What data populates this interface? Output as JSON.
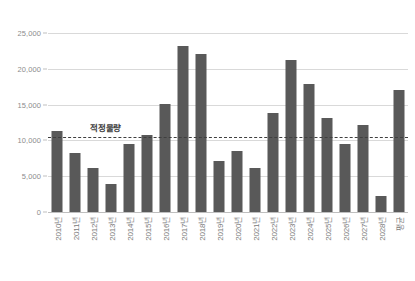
{
  "chart_data": {
    "type": "bar",
    "title": "",
    "subtitle": "",
    "xlabel": "",
    "ylabel": "",
    "ylim": [
      0,
      25000
    ],
    "yticks": [
      "0",
      "5,000",
      "10,000",
      "15,000",
      "20,000",
      "25,000"
    ],
    "ytick_values": [
      0,
      5000,
      10000,
      15000,
      20000,
      25000
    ],
    "grid": true,
    "legend_position": "none",
    "bar_color": "#595959",
    "gridline_color": "#d9d9d9",
    "categories": [
      "2010년",
      "2011년",
      "2012년",
      "2013년",
      "2014년",
      "2015년",
      "2016년",
      "2017년",
      "2018년",
      "2019년",
      "2020년",
      "2021년",
      "2022년",
      "2023년",
      "2024년",
      "2025년",
      "2026년",
      "2027년",
      "2028년",
      "평균"
    ],
    "values": [
      11300,
      8200,
      6200,
      3900,
      9500,
      10800,
      15100,
      23200,
      22000,
      7100,
      8500,
      6100,
      13800,
      21200,
      17900,
      13100,
      9500,
      12200,
      2300,
      17000
    ],
    "series": [
      {
        "name": "물량",
        "values": [
          11300,
          8200,
          6200,
          3900,
          9500,
          10800,
          15100,
          23200,
          22000,
          7100,
          8500,
          6100,
          13800,
          21200,
          17900,
          13100,
          9500,
          12200,
          2300,
          17000
        ]
      }
    ],
    "annotations": [
      {
        "name": "target-line",
        "label": "적정물량",
        "value": 10500,
        "style": "dashed",
        "color": "#3f3f3f"
      }
    ]
  }
}
